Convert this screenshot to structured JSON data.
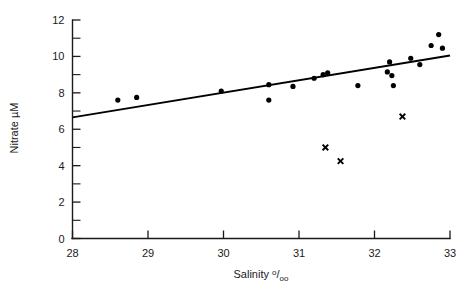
{
  "chart_data": {
    "type": "scatter",
    "title": "",
    "xlabel": "Salinity º/oo",
    "ylabel": "Nitrate µM",
    "xlim": [
      28,
      33
    ],
    "ylim": [
      0,
      12
    ],
    "grid": false,
    "legend": "none",
    "x_ticks": [
      28,
      29,
      30,
      31,
      32,
      33
    ],
    "x_tick_labels": [
      "28",
      "29",
      "30",
      "31",
      "32",
      "33"
    ],
    "x_minor_ticks": [],
    "y_ticks": [
      0,
      2,
      4,
      6,
      8,
      10,
      12
    ],
    "y_tick_labels": [
      "0",
      "2",
      "4",
      "6",
      "8",
      "10",
      "12"
    ],
    "y_minor_ticks": [
      1,
      3,
      5,
      7,
      9,
      11
    ],
    "series": [
      {
        "name": "nitrate-dots",
        "marker": "circle",
        "points": [
          [
            28.6,
            7.6
          ],
          [
            28.85,
            7.75
          ],
          [
            29.97,
            8.1
          ],
          [
            30.6,
            8.45
          ],
          [
            30.6,
            7.6
          ],
          [
            30.92,
            8.35
          ],
          [
            31.2,
            8.8
          ],
          [
            31.32,
            9.0
          ],
          [
            31.38,
            9.1
          ],
          [
            31.78,
            8.4
          ],
          [
            32.17,
            9.15
          ],
          [
            32.23,
            8.95
          ],
          [
            32.2,
            9.7
          ],
          [
            32.25,
            8.4
          ],
          [
            32.48,
            9.9
          ],
          [
            32.6,
            9.55
          ],
          [
            32.75,
            10.6
          ],
          [
            32.85,
            11.2
          ],
          [
            32.9,
            10.45
          ]
        ]
      },
      {
        "name": "nitrate-crosses",
        "marker": "cross",
        "points": [
          [
            31.35,
            5.0
          ],
          [
            31.55,
            4.25
          ],
          [
            32.37,
            6.7
          ]
        ]
      }
    ],
    "fit_line": {
      "name": "regression-line",
      "x": [
        28.0,
        33.0
      ],
      "y": [
        6.65,
        10.05
      ]
    }
  }
}
